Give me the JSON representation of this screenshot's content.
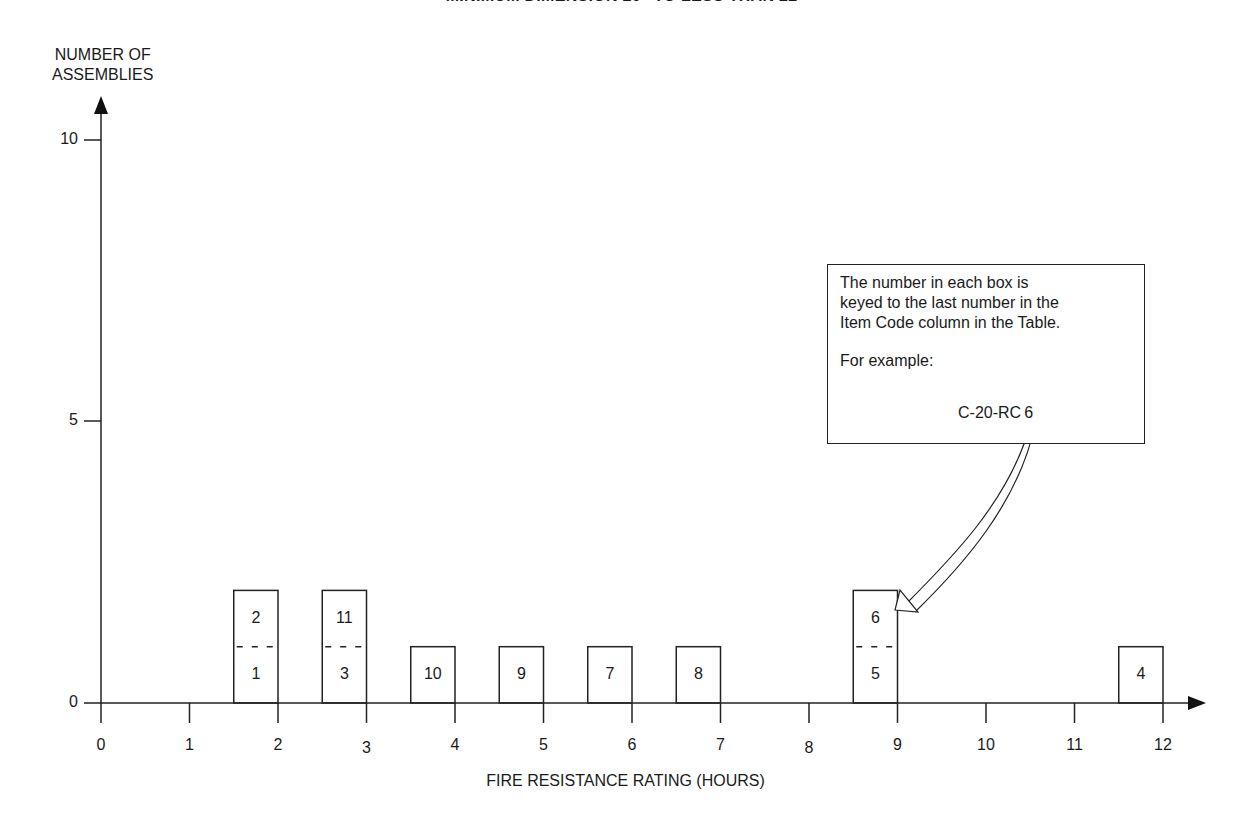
{
  "title": "MINIMUM DIMENSION 20\" TO LESS THAN 22\"",
  "chart_data": {
    "type": "bar",
    "title": "MINIMUM DIMENSION 20\" TO LESS THAN 22\"",
    "xlabel": "FIRE RESISTANCE RATING (HOURS)",
    "ylabel": "NUMBER OF ASSEMBLIES",
    "xlim": [
      0,
      12
    ],
    "ylim": [
      0,
      10
    ],
    "x_ticks": [
      "0",
      "1",
      "2",
      "3",
      "4",
      "5",
      "6",
      "7",
      "8",
      "9",
      "10",
      "11",
      "12"
    ],
    "y_ticks": [
      "0",
      "5",
      "10"
    ],
    "grid": false,
    "categories": [
      "2",
      "3",
      "4",
      "5",
      "6",
      "7",
      "9",
      "12"
    ],
    "values": [
      2,
      2,
      1,
      1,
      1,
      1,
      2,
      1
    ],
    "stacks": [
      {
        "x": 2,
        "items": [
          "1",
          "2"
        ]
      },
      {
        "x": 3,
        "items": [
          "3",
          "11"
        ]
      },
      {
        "x": 4,
        "items": [
          "10"
        ]
      },
      {
        "x": 5,
        "items": [
          "9"
        ]
      },
      {
        "x": 6,
        "items": [
          "7"
        ]
      },
      {
        "x": 7,
        "items": [
          "8"
        ]
      },
      {
        "x": 9,
        "items": [
          "5",
          "6"
        ]
      },
      {
        "x": 12,
        "items": [
          "4"
        ]
      }
    ],
    "annotation": {
      "text": "The number in each box is keyed to the last number in the Item Code column in the Table.",
      "example_label": "For example:",
      "example_code": "C-20-RC-6",
      "points_to": "box 6 at 9 hours"
    }
  },
  "axes": {
    "ylabel_line1": "NUMBER OF",
    "ylabel_line2": "ASSEMBLIES",
    "xlabel": "FIRE RESISTANCE RATING (HOURS)"
  },
  "note": {
    "line1": "The number in each box is",
    "line2": "keyed to the last number in the",
    "line3": "Item Code column in the Table.",
    "example_label": "For example:",
    "example_code": "C-20-RC",
    "example_digit": "6"
  }
}
